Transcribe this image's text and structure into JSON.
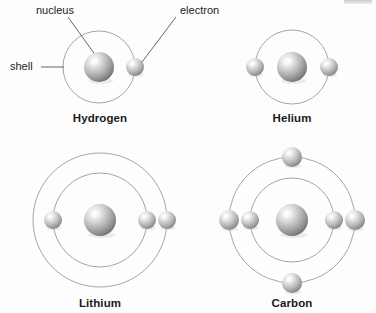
{
  "figure": {
    "background_color": "#fdfdfd",
    "shell_stroke_color": "#9b9b9b",
    "leader_line_color": "#555555",
    "sphere_light_color": "#f2f2f2",
    "sphere_mid_color": "#b4b4b4",
    "sphere_dark_color": "#6e6e6e",
    "label_color": "#1a1a1a",
    "callout_color": "#232323"
  },
  "callouts": [
    {
      "id": "nucleus",
      "label": "nucleus",
      "text_x": 36,
      "text_y": 4,
      "line_x1": 68,
      "line_y1": 17,
      "line_x2": 101,
      "line_y2": 63
    },
    {
      "id": "electron",
      "label": "electron",
      "text_x": 180,
      "text_y": 4,
      "line_x1": 176,
      "line_y1": 17,
      "line_x2": 139,
      "line_y2": 66
    },
    {
      "id": "shell",
      "label": "shell",
      "text_x": 10,
      "text_y": 60,
      "line_x1": 41,
      "line_y1": 67,
      "line_x2": 64,
      "line_y2": 67
    }
  ],
  "atoms": [
    {
      "id": "hydrogen",
      "name": "Hydrogen",
      "label_x": 100,
      "label_y": 112,
      "center_x": 99,
      "center_y": 67,
      "nucleus_radius": 15,
      "shells": [
        {
          "radius": 36,
          "electrons": [
            {
              "angle": 0,
              "radius": 9
            }
          ]
        }
      ]
    },
    {
      "id": "helium",
      "name": "Helium",
      "label_x": 292,
      "label_y": 112,
      "center_x": 292,
      "center_y": 67,
      "nucleus_radius": 15,
      "shells": [
        {
          "radius": 37,
          "electrons": [
            {
              "angle": 180,
              "radius": 9
            },
            {
              "angle": 0,
              "radius": 9
            }
          ]
        }
      ]
    },
    {
      "id": "lithium",
      "name": "Lithium",
      "label_x": 100,
      "label_y": 297,
      "center_x": 100,
      "center_y": 220,
      "nucleus_radius": 16,
      "shells": [
        {
          "radius": 47,
          "electrons": [
            {
              "angle": 180,
              "radius": 9
            },
            {
              "angle": 0,
              "radius": 9
            }
          ]
        },
        {
          "radius": 67,
          "electrons": [
            {
              "angle": 0,
              "radius": 9
            }
          ]
        }
      ]
    },
    {
      "id": "carbon",
      "name": "Carbon",
      "label_x": 292,
      "label_y": 297,
      "center_x": 292,
      "center_y": 220,
      "nucleus_radius": 16,
      "shells": [
        {
          "radius": 42,
          "electrons": [
            {
              "angle": 180,
              "radius": 9
            },
            {
              "angle": 0,
              "radius": 9
            }
          ]
        },
        {
          "radius": 63,
          "electrons": [
            {
              "angle": 180,
              "radius": 10
            },
            {
              "angle": 0,
              "radius": 10
            },
            {
              "angle": 270,
              "radius": 10
            },
            {
              "angle": 90,
              "radius": 10
            }
          ]
        }
      ]
    }
  ]
}
